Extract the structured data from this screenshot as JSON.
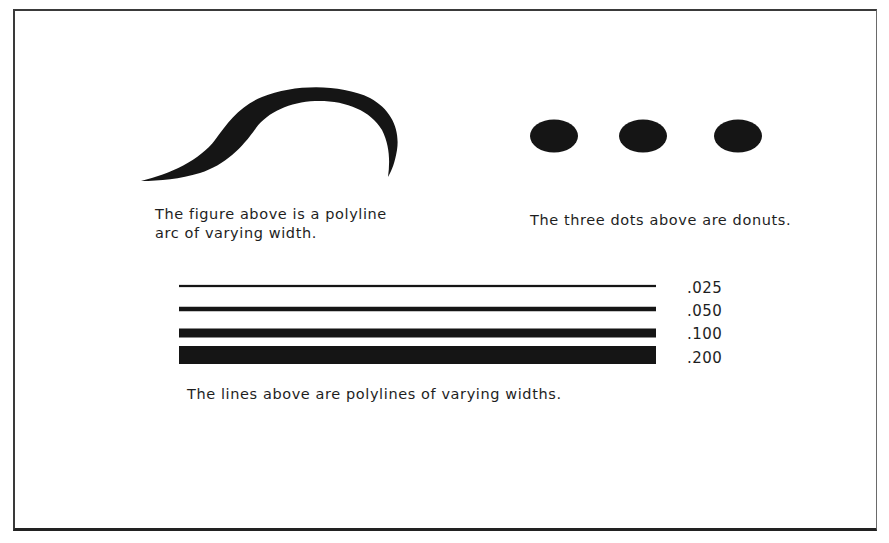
{
  "figure": {
    "ink_color": "#151515",
    "arc": {
      "name": "polyline-arc",
      "caption_lines": [
        "The figure above is a polyline",
        "arc of varying width."
      ]
    },
    "donuts": {
      "count": 3,
      "caption": "The three dots above are donuts."
    },
    "polylines": {
      "items": [
        {
          "label": ".025",
          "width": 0.025
        },
        {
          "label": ".050",
          "width": 0.05
        },
        {
          "label": ".100",
          "width": 0.1
        },
        {
          "label": ".200",
          "width": 0.2
        }
      ],
      "caption": "The lines above are polylines of varying widths."
    }
  }
}
